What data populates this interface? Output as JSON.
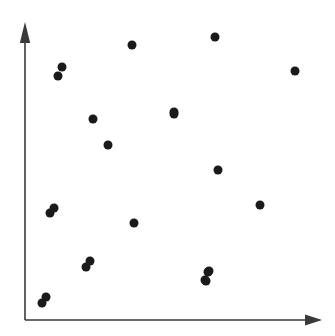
{
  "figure": {
    "width": 335,
    "height": 336,
    "background_color": "#ffffff",
    "kind": "scatter-plot-figure"
  },
  "chart_data": {
    "type": "scatter",
    "title": "",
    "subtitle": "",
    "xlabel": "",
    "ylabel": "",
    "xlim": [
      0,
      100
    ],
    "ylim": [
      0,
      100
    ],
    "grid": false,
    "legend": null,
    "legend_position": "none",
    "xticks": [],
    "yticks": [],
    "xticklabels": [],
    "yticklabels": [],
    "annotations": [],
    "marker": {
      "shape": "circle",
      "color": "#1a1a1a",
      "size_px": 9
    },
    "n_points": 22,
    "series": [
      {
        "name": "points",
        "color": "#1a1a1a",
        "x": [
          36.0,
          11.4,
          12.7,
          64.4,
          90.9,
          23.2,
          51.1,
          50.2,
          28.2,
          79.7,
          9.3,
          8.9,
          80.4,
          37.0,
          21.6,
          22.6,
          6.4,
          5.4,
          62.0,
          61.0,
          62.3,
          61.4
        ],
        "y": [
          86.8,
          84.8,
          81.8,
          91.2,
          81.2,
          67.3,
          69.7,
          61.9,
          59.4,
          50.5,
          36.0,
          34.5,
          38.7,
          32.8,
          19.7,
          17.3,
          6.1,
          4.2,
          16.1,
          13.6,
          16.4,
          13.9
        ]
      }
    ],
    "points_pixel": [
      {
        "cx": 132,
        "cy": 45
      },
      {
        "cx": 62,
        "cy": 67
      },
      {
        "cx": 58,
        "cy": 76
      },
      {
        "cx": 215,
        "cy": 37
      },
      {
        "cx": 295,
        "cy": 71
      },
      {
        "cx": 93,
        "cy": 119
      },
      {
        "cx": 174,
        "cy": 112
      },
      {
        "cx": 174,
        "cy": 114
      },
      {
        "cx": 108,
        "cy": 145
      },
      {
        "cx": 218,
        "cy": 170
      },
      {
        "cx": 54,
        "cy": 208
      },
      {
        "cx": 50,
        "cy": 213
      },
      {
        "cx": 260,
        "cy": 205
      },
      {
        "cx": 134,
        "cy": 223
      },
      {
        "cx": 90,
        "cy": 261
      },
      {
        "cx": 86,
        "cy": 267
      },
      {
        "cx": 46,
        "cy": 297
      },
      {
        "cx": 42,
        "cy": 303
      },
      {
        "cx": 208,
        "cy": 272
      },
      {
        "cx": 205,
        "cy": 280
      },
      {
        "cx": 209,
        "cy": 271
      },
      {
        "cx": 206,
        "cy": 281
      }
    ]
  },
  "axes": {
    "color": "#3a3a3a",
    "line_width": 1.6,
    "origin": {
      "x": 25,
      "y": 320
    },
    "y_axis": {
      "name": "vertical-axis",
      "x": 25,
      "y_top": 22,
      "y_bottom": 320,
      "arrow": "up"
    },
    "x_axis": {
      "name": "horizontal-axis",
      "y": 320,
      "x_left": 25,
      "x_right": 322,
      "arrow": "right"
    }
  }
}
